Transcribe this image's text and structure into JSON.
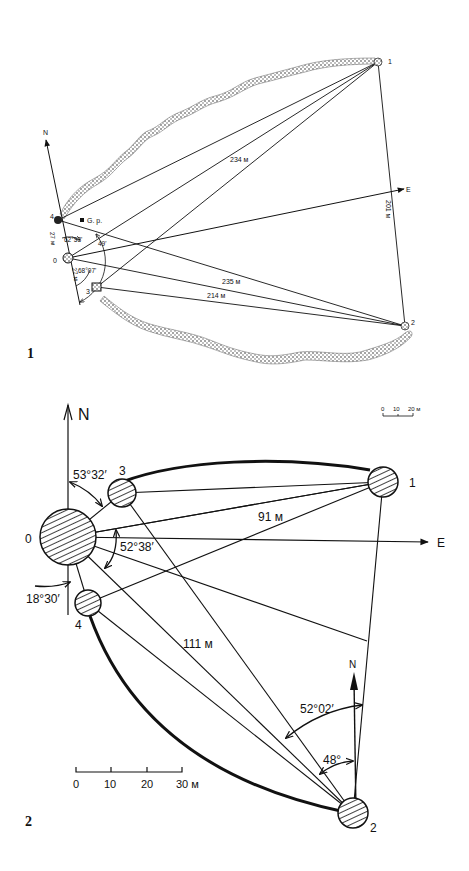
{
  "figure1": {
    "label": "1",
    "points": [
      {
        "id": "1",
        "label": "1"
      },
      {
        "id": "2",
        "label": "2"
      },
      {
        "id": "0",
        "label": "0"
      },
      {
        "id": "3",
        "label": "3"
      },
      {
        "id": "4",
        "label": "4"
      }
    ],
    "north_label": "N",
    "east_label": "E",
    "gp_label": "G. p.",
    "distances": {
      "d234": "234 м",
      "d235": "235 м",
      "d214": "214 м",
      "d201": "201 м",
      "d27a": "27 м",
      "d27b": "27 м"
    },
    "angles": {
      "a1": "62°53'",
      "a2": "49'",
      "a3": "68°07'"
    },
    "scale": {
      "ticks": [
        "0",
        "10",
        "20 м"
      ]
    }
  },
  "figure2": {
    "label": "2",
    "points": [
      {
        "id": "0",
        "label": "0"
      },
      {
        "id": "1",
        "label": "1"
      },
      {
        "id": "2",
        "label": "2"
      },
      {
        "id": "3",
        "label": "3"
      },
      {
        "id": "4",
        "label": "4"
      }
    ],
    "north_label": "N",
    "north2_label": "N",
    "east_label": "E",
    "distances": {
      "d91": "91 м",
      "d111": "111 м"
    },
    "angles": {
      "a1": "53°32′",
      "a2": "52°38′",
      "a3": "18°30′",
      "a4": "52°02′",
      "a5": "48°"
    },
    "scale": {
      "ticks": [
        "0",
        "10",
        "20",
        "30 м"
      ]
    }
  }
}
